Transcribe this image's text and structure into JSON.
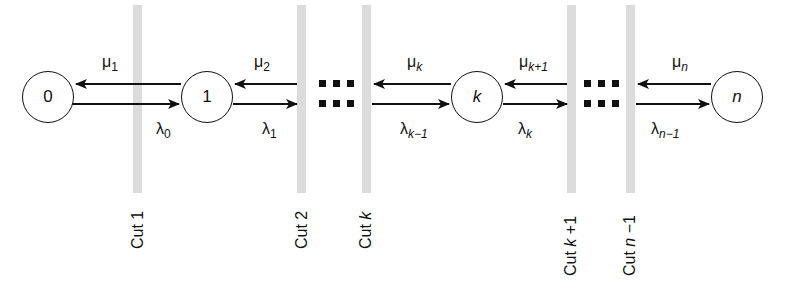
{
  "diagram": {
    "type": "birth-death chain with cuts",
    "nodes": [
      {
        "id": "0",
        "label": "0",
        "italic": false,
        "cx": 48
      },
      {
        "id": "1",
        "label": "1",
        "italic": false,
        "cx": 207
      },
      {
        "id": "k",
        "label": "k",
        "italic": true,
        "cx": 477
      },
      {
        "id": "n",
        "label": "n",
        "italic": true,
        "cx": 737
      }
    ],
    "ellipses": [
      {
        "between": [
          "1",
          "k"
        ],
        "symbol": "⋯ ⋯"
      },
      {
        "between": [
          "k",
          "n"
        ],
        "symbol": "⋯ ⋯"
      }
    ],
    "rates": {
      "mu": [
        {
          "base": "μ",
          "sub": "1",
          "sub_italic": false
        },
        {
          "base": "μ",
          "sub": "2",
          "sub_italic": false
        },
        {
          "base": "μ",
          "sub": "k",
          "sub_italic": true
        },
        {
          "base": "μ",
          "sub": "k+1",
          "sub_italic": true
        },
        {
          "base": "μ",
          "sub": "n",
          "sub_italic": true
        }
      ],
      "lambda": [
        {
          "base": "λ",
          "sub": "0",
          "sub_italic": false
        },
        {
          "base": "λ",
          "sub": "1",
          "sub_italic": false
        },
        {
          "base": "λ",
          "sub": "k−1",
          "sub_italic": true
        },
        {
          "base": "λ",
          "sub": "k",
          "sub_italic": true
        },
        {
          "base": "λ",
          "sub": "n−1",
          "sub_italic": true
        }
      ]
    },
    "cuts": [
      {
        "prefix": "Cut",
        "var": "",
        "suffix": "1",
        "x": 137
      },
      {
        "prefix": "Cut",
        "var": "",
        "suffix": "2",
        "x": 301
      },
      {
        "prefix": "Cut",
        "var": "k",
        "suffix": "",
        "x": 366
      },
      {
        "prefix": "Cut",
        "var": "k",
        "suffix": " +1",
        "x": 571
      },
      {
        "prefix": "Cut",
        "var": "n",
        "suffix": " −1",
        "x": 630
      }
    ],
    "colors": {
      "ink": "#111111",
      "cut_bar": "#dcdcdc",
      "background": "#ffffff"
    }
  }
}
